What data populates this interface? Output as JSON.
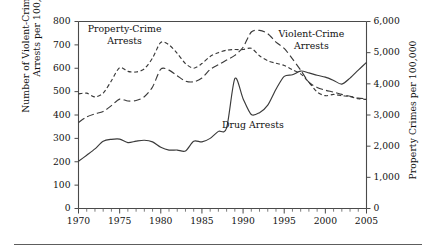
{
  "chart_data": {
    "type": "line",
    "title": "",
    "xlabel": "",
    "ylabel": "Number of Violent-Crime and Drug\nArrests per 100,000",
    "ylabel_right": "Property Crimes per 100,000",
    "grid": false,
    "legend_position": "inline-annotations",
    "xlim": [
      1970,
      2005
    ],
    "ylim": [
      0,
      800
    ],
    "ylim_right": [
      0,
      6000
    ],
    "xticks": [
      1970,
      1975,
      1980,
      1985,
      1990,
      1995,
      2000,
      2005
    ],
    "xticklabels": [
      "1970",
      "1975",
      "1980",
      "1985",
      "1990",
      "1995",
      "2000",
      "2005"
    ],
    "xtick_minor_step": 1,
    "yticks": [
      0,
      100,
      200,
      300,
      400,
      500,
      600,
      700,
      800
    ],
    "yticklabels": [
      "0",
      "100",
      "200",
      "300",
      "400",
      "500",
      "600",
      "700",
      "800"
    ],
    "yticks_right": [
      0,
      1000,
      2000,
      3000,
      4000,
      5000,
      6000
    ],
    "yticklabels_right": [
      "0",
      "1,000",
      "2,000",
      "3,000",
      "4,000",
      "5,000",
      "6,000"
    ],
    "x": [
      1970,
      1971,
      1972,
      1973,
      1974,
      1975,
      1976,
      1977,
      1978,
      1979,
      1980,
      1981,
      1982,
      1983,
      1984,
      1985,
      1986,
      1987,
      1988,
      1989,
      1990,
      1991,
      1992,
      1993,
      1994,
      1995,
      1996,
      1997,
      1998,
      1999,
      2000,
      2001,
      2002,
      2003,
      2004,
      2005
    ],
    "series": [
      {
        "name": "Property-Crime Arrests",
        "axis": "right",
        "style": "short-dashed",
        "units": "property crimes per 100,000",
        "values": [
          3680,
          3700,
          3580,
          3700,
          4100,
          4520,
          4400,
          4380,
          4480,
          4830,
          5330,
          5250,
          4980,
          4650,
          4500,
          4650,
          4880,
          5000,
          5080,
          5100,
          5100,
          5140,
          4900,
          4740,
          4660,
          4590,
          4450,
          4320,
          4050,
          3740,
          3620,
          3660,
          3620,
          3590,
          3520,
          3500
        ]
      },
      {
        "name": "Violent-Crime Arrests",
        "axis": "left",
        "style": "long-dashed",
        "units": "arrests per 100,000",
        "values": [
          368,
          392,
          405,
          415,
          440,
          468,
          460,
          462,
          478,
          520,
          596,
          592,
          568,
          545,
          542,
          558,
          595,
          615,
          635,
          655,
          690,
          755,
          762,
          748,
          712,
          685,
          640,
          592,
          540,
          518,
          506,
          498,
          488,
          480,
          472,
          470
        ]
      },
      {
        "name": "Drug Arrests",
        "axis": "left",
        "style": "solid",
        "units": "arrests per 100,000",
        "values": [
          202,
          228,
          255,
          288,
          296,
          297,
          282,
          288,
          292,
          285,
          262,
          250,
          250,
          246,
          288,
          285,
          300,
          330,
          345,
          556,
          470,
          402,
          410,
          442,
          510,
          565,
          572,
          588,
          580,
          570,
          562,
          548,
          532,
          558,
          592,
          625
        ]
      }
    ],
    "annotations": [
      {
        "text": "Property-Crime Arrests",
        "x": 1975.6,
        "y_left": 762,
        "align": "center"
      },
      {
        "text": "Violent-Crime\nArrests",
        "x": 1998.3,
        "y_left": 742,
        "align": "center"
      },
      {
        "text": "Drug Arrests",
        "x": 1991.2,
        "y_left": 352,
        "align": "center"
      }
    ]
  },
  "axes": {
    "left": {
      "title": "Number of Violent-Crime and Drug\nArrests per 100,000"
    },
    "right": {
      "title": "Property Crimes per 100,000"
    }
  }
}
